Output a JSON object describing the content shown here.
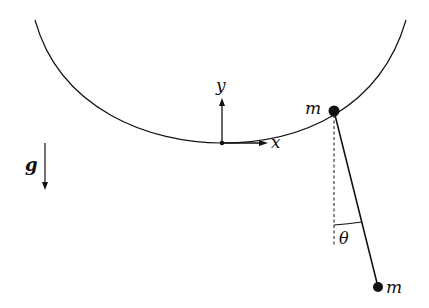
{
  "diagram": {
    "labels": {
      "y_axis": "y",
      "x_axis": "x",
      "upper_mass": "m",
      "lower_mass": "m",
      "gravity": "g",
      "angle": "θ"
    },
    "colors": {
      "stroke": "#111111",
      "background": "#ffffff"
    }
  }
}
